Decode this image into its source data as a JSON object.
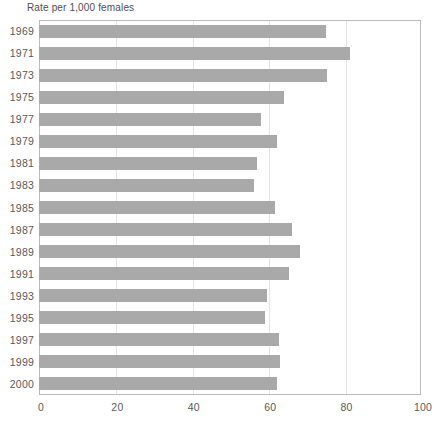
{
  "chart_data": {
    "type": "bar",
    "orientation": "horizontal",
    "title": "Rate per 1,000 females",
    "xlabel": "",
    "ylabel": "",
    "xlim": [
      0,
      100
    ],
    "xticks": [
      0,
      20,
      40,
      60,
      80,
      100
    ],
    "xtick_labels": [
      "0",
      "20",
      "40",
      "60",
      "80",
      "100"
    ],
    "grid": "vertical",
    "legend": "none",
    "bar_color": "#a9a9a9",
    "frame_color": "#b9bbbd",
    "gridline_color": "#e3e4e5",
    "categories": [
      "1969",
      "1971",
      "1973",
      "1975",
      "1977",
      "1979",
      "1981",
      "1983",
      "1985",
      "1987",
      "1989",
      "1991",
      "1993",
      "1995",
      "1997",
      "1999",
      "2000"
    ],
    "values": [
      75.1,
      81.3,
      75.3,
      64.2,
      58.1,
      62.2,
      57.0,
      56.4,
      61.8,
      66.2,
      68.2,
      65.4,
      59.7,
      59.1,
      62.7,
      63.0,
      62.4
    ]
  }
}
